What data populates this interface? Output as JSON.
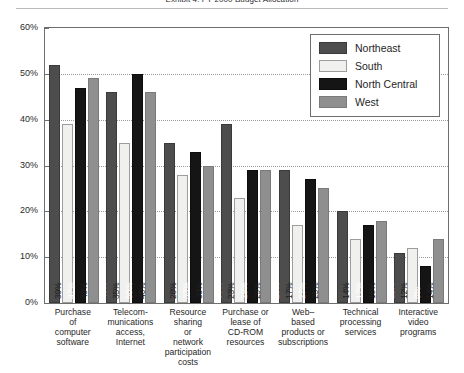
{
  "title": "Exhibit 4. FY 2000 Budget Allocation",
  "legend": {
    "position": "top-right-inside",
    "items": [
      {
        "label": "Northeast",
        "color": "#4d4d4d"
      },
      {
        "label": "South",
        "color": "#f0f0ee"
      },
      {
        "label": "North Central",
        "color": "#151515"
      },
      {
        "label": "West",
        "color": "#8f8f8f"
      }
    ]
  },
  "yaxis": {
    "ticks": [
      "0%",
      "10%",
      "20%",
      "30%",
      "40%",
      "50%",
      "60%"
    ],
    "min": 0,
    "max": 60
  },
  "chart_data": {
    "type": "bar",
    "title": "Exhibit 4. FY 2000 Budget Allocation",
    "xlabel": "",
    "ylabel": "",
    "ylim": [
      0,
      60
    ],
    "grid": true,
    "legend_position": "upper right",
    "value_suffix": "%",
    "categories": [
      "Purchase of computer software",
      "Telecom-munications access, Internet",
      "Resource sharing or network participation costs",
      "Purchase or lease of CD-ROM resources",
      "Web-based products or subscriptions",
      "Technical processing services",
      "Interactive video programs"
    ],
    "category_lines": [
      [
        "Purchase",
        "of",
        "computer",
        "software"
      ],
      [
        "Telecom-",
        "munications",
        "access,",
        "Internet"
      ],
      [
        "Resource",
        "sharing",
        "or",
        "network",
        "participation",
        "costs"
      ],
      [
        "Purchase or",
        "lease of",
        "CD-ROM",
        "resources"
      ],
      [
        "Web–",
        "based",
        "products or",
        "subscriptions"
      ],
      [
        "Technical",
        "processing",
        "services"
      ],
      [
        "Interactive",
        "video",
        "programs"
      ]
    ],
    "series": [
      {
        "name": "Northeast",
        "color": "#4d4d4d",
        "values": [
          52,
          46,
          35,
          39,
          29,
          20,
          11
        ]
      },
      {
        "name": "South",
        "color": "#f0f0ee",
        "values": [
          39,
          35,
          28,
          23,
          17,
          14,
          12
        ]
      },
      {
        "name": "North Central",
        "color": "#151515",
        "values": [
          47,
          50,
          33,
          29,
          27,
          17,
          8
        ]
      },
      {
        "name": "West",
        "color": "#8f8f8f",
        "values": [
          49,
          46,
          30,
          29,
          25,
          18,
          14
        ]
      }
    ],
    "data_labels": [
      [
        "52%",
        "39%",
        "47%",
        "49%"
      ],
      [
        "46%",
        "35%",
        "50%",
        "46%"
      ],
      [
        "35%",
        "28%",
        "33%",
        "30%"
      ],
      [
        "39%",
        "23%",
        "29%",
        "29%"
      ],
      [
        "29%",
        "17%",
        "27%",
        "25%"
      ],
      [
        "20%",
        "14%",
        "17%",
        "18%"
      ],
      [
        "11%",
        "12%",
        "8%",
        "14%"
      ]
    ]
  }
}
